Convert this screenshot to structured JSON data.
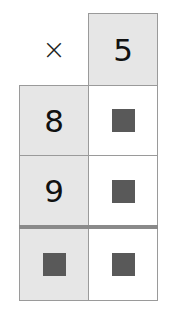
{
  "diagram": {
    "operator": "×",
    "top_factor": "5",
    "left_factors": [
      "8",
      "9"
    ],
    "products": [
      "■",
      "■"
    ],
    "sum_row": {
      "left": "■",
      "right": "■"
    },
    "colors": {
      "shaded_cell": "#e6e6e6",
      "border": "#9a9a9a",
      "blank_square": "#595959",
      "sum_divider": "#8a8a8a"
    }
  }
}
